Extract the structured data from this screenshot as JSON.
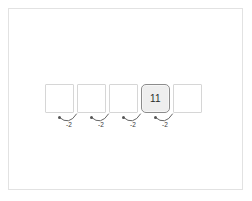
{
  "canvas": {
    "width": 252,
    "height": 201,
    "background_color": "#ffffff",
    "frame_border_color": "#e2e2e2"
  },
  "diagram": {
    "type": "sequence-subtraction-strip",
    "cell_count": 5,
    "cells": [
      {
        "index": 0,
        "value": "",
        "highlighted": false
      },
      {
        "index": 1,
        "value": "",
        "highlighted": false
      },
      {
        "index": 2,
        "value": "",
        "highlighted": false
      },
      {
        "index": 3,
        "value": "11",
        "highlighted": true
      },
      {
        "index": 4,
        "value": "",
        "highlighted": false
      }
    ],
    "arcs": [
      {
        "index": 0,
        "label": "-2",
        "direction": "right-to-left"
      },
      {
        "index": 1,
        "label": "-2",
        "direction": "right-to-left"
      },
      {
        "index": 2,
        "label": "-2",
        "direction": "right-to-left"
      },
      {
        "index": 3,
        "label": "-2",
        "direction": "right-to-left"
      }
    ],
    "colors": {
      "cell_border": "#d6d6d6",
      "cell_fill": "#ffffff",
      "highlight_border": "#8c8c8c",
      "highlight_fill": "#eeeeee",
      "arc_stroke": "#555555",
      "label_color": "#3a3a3a",
      "text_color": "#2a2a2a"
    }
  }
}
